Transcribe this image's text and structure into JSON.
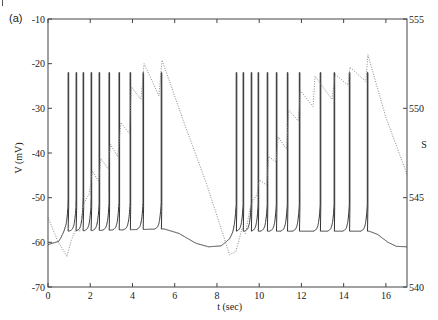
{
  "chart_data": {
    "type": "line",
    "panel_label": "(a)",
    "title": "",
    "xlabel": "t (sec)",
    "ylabel_left": "V  (mV)",
    "ylabel_right": "S",
    "xlim": [
      0,
      17
    ],
    "ylim_left": [
      -70,
      -10
    ],
    "ylim_right": [
      540,
      555
    ],
    "x_ticks": [
      0,
      2,
      4,
      6,
      8,
      10,
      12,
      14,
      16
    ],
    "x_tick_labels": [
      "0",
      "2",
      "4",
      "6",
      "8",
      "10",
      "12",
      "14",
      "16"
    ],
    "y_left_ticks": [
      -10,
      -20,
      -30,
      -40,
      -50,
      -60,
      -70
    ],
    "y_left_tick_labels": [
      "-10",
      "-20",
      "-30",
      "-40",
      "-50",
      "-60",
      "-70"
    ],
    "y_right_ticks": [
      555,
      550,
      545,
      540
    ],
    "y_right_tick_labels": [
      "555",
      "550",
      "545",
      "540"
    ],
    "grid": false,
    "legend": null,
    "series": [
      {
        "name": "V",
        "axis": "left",
        "style": "solid",
        "color": "#333333",
        "spike_peak_mV": -22,
        "spike_trough_mV": -57,
        "spike_times": [
          0.95,
          1.33,
          1.66,
          2.04,
          2.42,
          2.89,
          3.36,
          3.89,
          4.5,
          5.36,
          8.91,
          9.24,
          9.62,
          9.95,
          10.38,
          10.81,
          11.33,
          11.9,
          12.89,
          13.55,
          14.27,
          15.12
        ],
        "baseline": [
          [
            0,
            -60.5
          ],
          [
            0.5,
            -59.8
          ],
          [
            0.8,
            -57.5
          ],
          [
            5.5,
            -57.0
          ],
          [
            6.2,
            -58.0
          ],
          [
            7.0,
            -60.2
          ],
          [
            7.6,
            -61.0
          ],
          [
            8.2,
            -60.8
          ],
          [
            8.6,
            -59.2
          ],
          [
            8.85,
            -57.5
          ],
          [
            15.2,
            -57.5
          ],
          [
            15.6,
            -58.2
          ],
          [
            16.1,
            -60.0
          ],
          [
            16.5,
            -60.9
          ],
          [
            17,
            -61.0
          ]
        ]
      },
      {
        "name": "S",
        "axis": "right",
        "style": "dotted",
        "color": "#888888",
        "points": [
          [
            0,
            543.9
          ],
          [
            0.45,
            542.6
          ],
          [
            0.9,
            541.7
          ],
          [
            1.1,
            542.6
          ],
          [
            1.35,
            543.3
          ],
          [
            1.5,
            543.1
          ],
          [
            1.7,
            544.7
          ],
          [
            1.95,
            545.2
          ],
          [
            2.1,
            546.5
          ],
          [
            2.4,
            545.9
          ],
          [
            2.5,
            547.2
          ],
          [
            2.85,
            546.6
          ],
          [
            2.95,
            548.0
          ],
          [
            3.3,
            547.3
          ],
          [
            3.45,
            549.2
          ],
          [
            3.85,
            548.6
          ],
          [
            3.95,
            551.2
          ],
          [
            4.4,
            550.5
          ],
          [
            4.55,
            552.5
          ],
          [
            5.25,
            550.7
          ],
          [
            5.4,
            552.7
          ],
          [
            6.5,
            549.0
          ],
          [
            7.5,
            545.8
          ],
          [
            8.6,
            541.8
          ],
          [
            8.9,
            542.0
          ],
          [
            9.2,
            543.3
          ],
          [
            9.35,
            543.0
          ],
          [
            9.6,
            544.6
          ],
          [
            9.9,
            545.2
          ],
          [
            10.0,
            546.0
          ],
          [
            10.35,
            545.7
          ],
          [
            10.45,
            547.3
          ],
          [
            10.8,
            547.0
          ],
          [
            10.9,
            548.4
          ],
          [
            11.3,
            547.7
          ],
          [
            11.4,
            549.9
          ],
          [
            11.85,
            549.3
          ],
          [
            11.95,
            551.0
          ],
          [
            12.55,
            550.1
          ],
          [
            12.65,
            551.8
          ],
          [
            13.45,
            550.5
          ],
          [
            13.6,
            551.9
          ],
          [
            14.2,
            551.3
          ],
          [
            14.3,
            552.3
          ],
          [
            15.05,
            551.5
          ],
          [
            15.15,
            553.0
          ],
          [
            16.0,
            549.5
          ],
          [
            17,
            546.3
          ]
        ]
      }
    ]
  }
}
